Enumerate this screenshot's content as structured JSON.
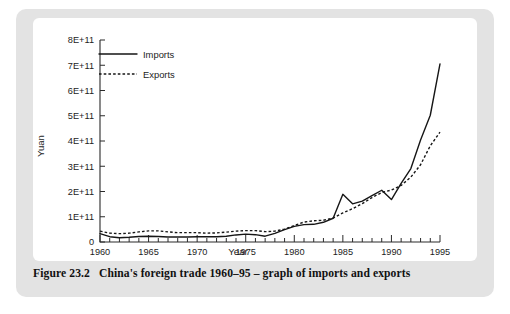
{
  "caption": {
    "number": "Figure 23.2",
    "text": "China's foreign trade 1960–95 – graph of imports and exports"
  },
  "colors": {
    "panel_background": "#e3e3e3",
    "plot_background": "#ffffff",
    "line": "#161616",
    "text": "#1c1c1c"
  },
  "legend": {
    "imports_label": "Imports",
    "exports_label": "Exports"
  },
  "chart_data": {
    "type": "line",
    "title": "",
    "xlabel": "Year",
    "ylabel": "Yuan",
    "xlim": [
      1960,
      1995
    ],
    "ylim": [
      0,
      800000000000
    ],
    "grid": false,
    "legend_position": "top-left-inside",
    "x_tick_labels": [
      "1960",
      "1965",
      "1970",
      "1975",
      "1980",
      "1985",
      "1990",
      "1995"
    ],
    "x_major_ticks": [
      1960,
      1965,
      1970,
      1975,
      1980,
      1985,
      1990,
      1995
    ],
    "x_minor_tick_step": 1,
    "y_tick_labels": [
      "0",
      "1E+11",
      "2E+11",
      "3E+11",
      "4E+11",
      "5E+11",
      "6E+11",
      "7E+11",
      "8E+11"
    ],
    "y_tick_values": [
      0,
      100000000000,
      200000000000,
      300000000000,
      400000000000,
      500000000000,
      600000000000,
      700000000000,
      800000000000
    ],
    "x": [
      1960,
      1961,
      1962,
      1963,
      1964,
      1965,
      1966,
      1967,
      1968,
      1969,
      1970,
      1971,
      1972,
      1973,
      1974,
      1975,
      1976,
      1977,
      1978,
      1979,
      1980,
      1981,
      1982,
      1983,
      1984,
      1985,
      1986,
      1987,
      1988,
      1989,
      1990,
      1991,
      1992,
      1993,
      1994,
      1995
    ],
    "series": [
      {
        "name": "Imports",
        "style": "solid",
        "values": [
          33000000000,
          21000000000,
          17000000000,
          19000000000,
          22000000000,
          23000000000,
          22000000000,
          20000000000,
          20000000000,
          20000000000,
          21000000000,
          21000000000,
          21000000000,
          23000000000,
          28000000000,
          31000000000,
          29000000000,
          23000000000,
          34000000000,
          49000000000,
          62000000000,
          69000000000,
          70000000000,
          78000000000,
          94000000000,
          189000000000,
          151000000000,
          162000000000,
          184000000000,
          205000000000,
          168000000000,
          232000000000,
          291000000000,
          404000000000,
          502000000000,
          705000000000
        ]
      },
      {
        "name": "Exports",
        "style": "dotted",
        "values": [
          43000000000,
          35000000000,
          33000000000,
          35000000000,
          40000000000,
          44000000000,
          44000000000,
          40000000000,
          37000000000,
          37000000000,
          37000000000,
          35000000000,
          36000000000,
          39000000000,
          43000000000,
          45000000000,
          45000000000,
          41000000000,
          43000000000,
          51000000000,
          65000000000,
          79000000000,
          84000000000,
          86000000000,
          95000000000,
          115000000000,
          132000000000,
          152000000000,
          176000000000,
          196000000000,
          206000000000,
          224000000000,
          257000000000,
          306000000000,
          381000000000,
          435000000000
        ]
      }
    ]
  }
}
